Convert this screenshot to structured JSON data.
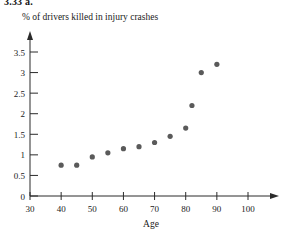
{
  "problem_label": "3.33 a.",
  "chart_data": {
    "type": "scatter",
    "title": "% of drivers killed in injury crashes",
    "xlabel": "Age",
    "ylabel": "",
    "xlim": [
      30,
      103
    ],
    "ylim": [
      0,
      3.6
    ],
    "xticks": [
      30,
      40,
      50,
      60,
      70,
      80,
      90,
      100
    ],
    "xtick_labels": [
      "30",
      "40",
      "50",
      "60",
      "70",
      "80",
      "90",
      "100"
    ],
    "yticks": [
      0,
      0.5,
      1,
      1.5,
      2,
      2.5,
      3,
      3.5
    ],
    "ytick_labels": [
      "0",
      "0.5",
      "1",
      "1.5",
      "2",
      "2.5",
      "3",
      "3.5"
    ],
    "grid": false,
    "legend": false,
    "point_color": "#5a5a5a",
    "axis_color": "#2b2b2b",
    "x": [
      40,
      45,
      50,
      55,
      60,
      65,
      70,
      75,
      80,
      85,
      90
    ],
    "y": [
      0.75,
      0.75,
      0.95,
      1.05,
      1.15,
      1.2,
      1.3,
      1.45,
      1.65,
      2.2,
      3.0
    ],
    "points": [
      {
        "age": 40,
        "percent": 0.75
      },
      {
        "age": 45,
        "percent": 0.75
      },
      {
        "age": 50,
        "percent": 0.95
      },
      {
        "age": 55,
        "percent": 1.05
      },
      {
        "age": 60,
        "percent": 1.15
      },
      {
        "age": 65,
        "percent": 1.2
      },
      {
        "age": 70,
        "percent": 1.3
      },
      {
        "age": 75,
        "percent": 1.45
      },
      {
        "age": 80,
        "percent": 1.65
      },
      {
        "age": 82,
        "percent": 2.2
      },
      {
        "age": 85,
        "percent": 3.0
      },
      {
        "age": 90,
        "percent": 3.2
      }
    ]
  }
}
